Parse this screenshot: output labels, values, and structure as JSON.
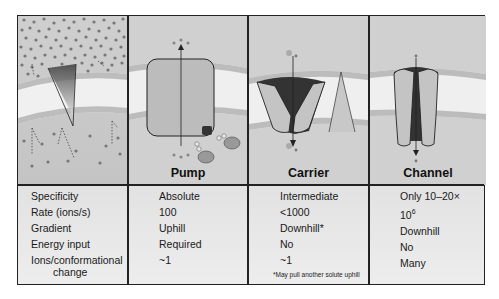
{
  "figure": {
    "panels": [
      {
        "id": "gradient",
        "label": ""
      },
      {
        "id": "pump",
        "label": "Pump"
      },
      {
        "id": "carrier",
        "label": "Carrier"
      },
      {
        "id": "channel",
        "label": "Channel"
      }
    ]
  },
  "table": {
    "row_labels": [
      "Specificity",
      "Rate (ions/s)",
      "Gradient",
      "Energy input",
      "Ions/conformational",
      "change"
    ],
    "pump": {
      "specificity": "Absolute",
      "rate": "100",
      "gradient": "Uphill",
      "energy": "Required",
      "ions": "~1"
    },
    "carrier": {
      "specificity": "Intermediate",
      "rate": "<1000",
      "gradient": "Downhill*",
      "energy": "No",
      "ions": "~1",
      "footnote": "*May pull another solute uphill"
    },
    "channel": {
      "specificity": "Only 10–20×",
      "rate_base": "10",
      "rate_exp": "6",
      "gradient": "Downhill",
      "energy": "No",
      "ions": "Many"
    }
  },
  "colors": {
    "frame": "#222222",
    "membrane": "#f2f2f2",
    "background": "#d9d9d9",
    "protein": "#c8c8c8",
    "pore": "#333333"
  }
}
